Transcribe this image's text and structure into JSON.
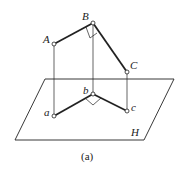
{
  "figure": {
    "caption": "(a)",
    "plane_label": "H",
    "points": {
      "A": "A",
      "B": "B",
      "C": "C",
      "a": "a",
      "b": "b",
      "c": "c"
    },
    "right_angle_at": [
      "B",
      "b"
    ],
    "colors": {
      "line": "#222222",
      "background": "#ffffff"
    }
  }
}
